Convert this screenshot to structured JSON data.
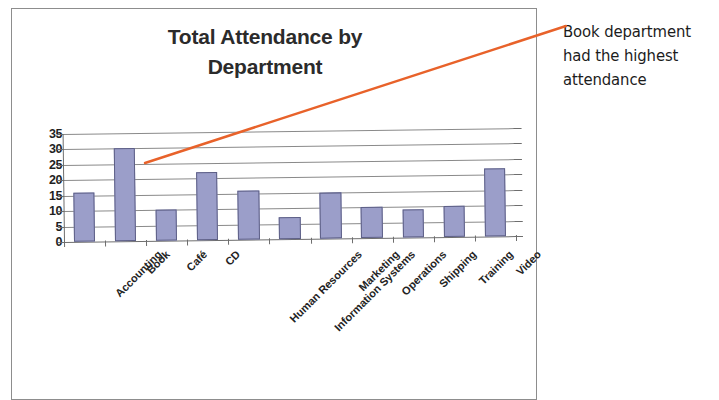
{
  "chart_data": {
    "type": "bar",
    "title": "Total Attendance by Department",
    "title_line1": "Total Attendance by",
    "title_line2": "Department",
    "xlabel": "",
    "ylabel": "",
    "categories": [
      "Accounting",
      "Book",
      "Café",
      "CD",
      "Human Resources",
      "Information Systems",
      "Marketing",
      "Operations",
      "Shipping",
      "Training",
      "Video"
    ],
    "values": [
      16,
      30,
      10,
      22,
      16,
      7,
      15,
      10,
      9,
      10,
      22
    ],
    "ylim": [
      0,
      35
    ],
    "yticks": [
      0,
      5,
      10,
      15,
      20,
      25,
      30,
      35
    ],
    "ytick_labels": [
      "0",
      "5",
      "10",
      "15",
      "20",
      "25",
      "30",
      "35"
    ],
    "grid": true,
    "legend": false,
    "bar_color": "#9b9ec9",
    "bar_border_color": "#5d5f86",
    "gridline_color": "#8a8a8a"
  },
  "annotation": {
    "text": "Book department had the highest attendance",
    "line1": "Book department",
    "line2": "had the highest",
    "line3": "attendance",
    "arrow_color": "#e8622a",
    "points_to_category": "Book"
  },
  "frame": {
    "border_color": "#8d8d8d"
  }
}
